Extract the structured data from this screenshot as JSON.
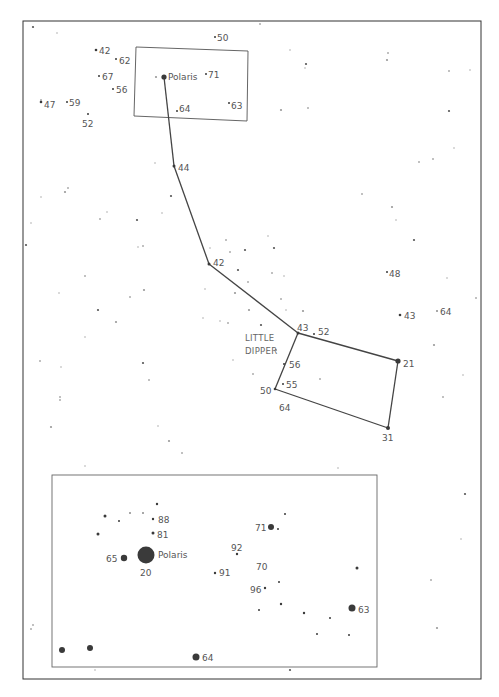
{
  "chart": {
    "title": "LITTLE DIPPER",
    "title_lines": [
      "LITTLE",
      "DIPPER"
    ],
    "colors": {
      "ink": "#3a3a3a",
      "label": "#555555",
      "faint": "#bbbbbb",
      "frame": "#333333",
      "inset_frame": "#666666"
    }
  },
  "main_map": {
    "frame": {
      "x": 23,
      "y": 21,
      "w": 458,
      "h": 658
    },
    "zoom_box": {
      "points": "136,47 248,51 247,121 134,116"
    },
    "constellation_lines": [
      [
        164,
        77,
        174,
        166
      ],
      [
        174,
        166,
        209,
        264
      ],
      [
        209,
        264,
        298,
        333
      ],
      [
        298,
        333,
        398,
        361
      ],
      [
        398,
        361,
        388,
        428
      ],
      [
        388,
        428,
        275,
        389
      ],
      [
        275,
        389,
        298,
        333
      ]
    ],
    "labeled_stars": [
      {
        "x": 164,
        "y": 77,
        "r": 2.6,
        "label": "Polaris",
        "lx": 168,
        "ly": 80
      },
      {
        "x": 174,
        "y": 166,
        "r": 1.5,
        "label": "44",
        "lx": 178,
        "ly": 171
      },
      {
        "x": 209,
        "y": 264,
        "r": 1.5,
        "label": "42",
        "lx": 213,
        "ly": 266
      },
      {
        "x": 298,
        "y": 333,
        "r": 1.5,
        "label": "43",
        "lx": 297,
        "ly": 331
      },
      {
        "x": 314,
        "y": 334,
        "r": 1,
        "label": "52",
        "lx": 318,
        "ly": 335
      },
      {
        "x": 398,
        "y": 361,
        "r": 2.6,
        "label": "21",
        "lx": 403,
        "ly": 367
      },
      {
        "x": 388,
        "y": 428,
        "r": 2,
        "label": "31",
        "lx": 382,
        "ly": 441
      },
      {
        "x": 275,
        "y": 389,
        "r": 1.3,
        "label": "50",
        "lx": 260,
        "ly": 394
      },
      {
        "x": 283,
        "y": 384,
        "r": 1,
        "label": "55",
        "lx": 286,
        "ly": 388
      },
      {
        "x": 284,
        "y": 364,
        "r": 1,
        "label": "56",
        "lx": 289,
        "ly": 368
      },
      {
        "x": 285,
        "y": 405,
        "r": 0,
        "label": "64",
        "lx": 279,
        "ly": 411
      },
      {
        "x": 387,
        "y": 272,
        "r": 1,
        "label": "48",
        "lx": 389,
        "ly": 277
      },
      {
        "x": 400,
        "y": 315,
        "r": 1.3,
        "label": "43",
        "lx": 404,
        "ly": 319
      },
      {
        "x": 437,
        "y": 311,
        "r": 0.8,
        "label": "64",
        "lx": 440,
        "ly": 315
      },
      {
        "x": 215,
        "y": 37,
        "r": 1,
        "label": "50",
        "lx": 217,
        "ly": 41
      },
      {
        "x": 96,
        "y": 50,
        "r": 1.3,
        "label": "42",
        "lx": 99,
        "ly": 54
      },
      {
        "x": 116,
        "y": 59,
        "r": 1,
        "label": "62",
        "lx": 119,
        "ly": 64
      },
      {
        "x": 99,
        "y": 76,
        "r": 1,
        "label": "67",
        "lx": 102,
        "ly": 80
      },
      {
        "x": 113,
        "y": 89,
        "r": 1,
        "label": "56",
        "lx": 116,
        "ly": 93
      },
      {
        "x": 41,
        "y": 102,
        "r": 1.3,
        "label": "47",
        "lx": 44,
        "ly": 108
      },
      {
        "x": 67,
        "y": 102,
        "r": 1,
        "label": "59",
        "lx": 69,
        "ly": 106
      },
      {
        "x": 88,
        "y": 114,
        "r": 1,
        "label": "52",
        "lx": 82,
        "ly": 127
      },
      {
        "x": 206,
        "y": 74,
        "r": 1,
        "label": "71",
        "lx": 208,
        "ly": 78
      },
      {
        "x": 177,
        "y": 111,
        "r": 1,
        "label": "64",
        "lx": 179,
        "ly": 112
      },
      {
        "x": 229,
        "y": 103,
        "r": 1,
        "label": "63",
        "lx": 231,
        "ly": 109
      }
    ],
    "background_stars": [
      [
        33,
        27
      ],
      [
        57,
        33
      ],
      [
        41,
        100
      ],
      [
        156,
        77
      ],
      [
        260,
        24
      ],
      [
        290,
        50
      ],
      [
        306,
        64
      ],
      [
        305,
        68
      ],
      [
        388,
        53
      ],
      [
        387,
        60
      ],
      [
        449,
        71
      ],
      [
        470,
        70
      ],
      [
        449,
        111
      ],
      [
        454,
        148
      ],
      [
        433,
        159
      ],
      [
        281,
        110
      ],
      [
        308,
        108
      ],
      [
        31,
        223
      ],
      [
        26,
        245
      ],
      [
        41,
        197
      ],
      [
        68,
        188
      ],
      [
        65,
        192
      ],
      [
        100,
        219
      ],
      [
        107,
        212
      ],
      [
        137,
        220
      ],
      [
        138,
        247
      ],
      [
        143,
        246
      ],
      [
        144,
        290
      ],
      [
        85,
        276
      ],
      [
        59,
        293
      ],
      [
        98,
        310
      ],
      [
        85,
        337
      ],
      [
        60,
        397
      ],
      [
        51,
        427
      ],
      [
        40,
        361
      ],
      [
        61,
        367
      ],
      [
        143,
        363
      ],
      [
        158,
        426
      ],
      [
        149,
        380
      ],
      [
        169,
        441
      ],
      [
        182,
        453
      ],
      [
        205,
        289
      ],
      [
        238,
        270
      ],
      [
        233,
        360
      ],
      [
        253,
        374
      ],
      [
        249,
        310
      ],
      [
        228,
        323
      ],
      [
        220,
        321
      ],
      [
        261,
        325
      ],
      [
        284,
        276
      ],
      [
        281,
        299
      ],
      [
        303,
        311
      ],
      [
        248,
        282
      ],
      [
        203,
        318
      ],
      [
        171,
        196
      ],
      [
        162,
        213
      ],
      [
        230,
        252
      ],
      [
        235,
        293
      ],
      [
        272,
        273
      ],
      [
        286,
        310
      ],
      [
        245,
        250
      ],
      [
        268,
        236
      ],
      [
        362,
        194
      ],
      [
        392,
        207
      ],
      [
        419,
        162
      ],
      [
        396,
        220
      ],
      [
        414,
        240
      ],
      [
        447,
        278
      ],
      [
        476,
        298
      ],
      [
        434,
        345
      ],
      [
        443,
        397
      ],
      [
        463,
        375
      ],
      [
        465,
        494
      ],
      [
        461,
        539
      ],
      [
        431,
        580
      ],
      [
        437,
        628
      ],
      [
        31,
        629
      ],
      [
        95,
        670
      ],
      [
        290,
        670
      ],
      [
        85,
        466
      ],
      [
        60,
        400
      ],
      [
        116,
        322
      ],
      [
        130,
        297
      ],
      [
        210,
        248
      ],
      [
        274,
        248
      ],
      [
        155,
        163
      ],
      [
        226,
        240
      ],
      [
        276,
        350
      ],
      [
        320,
        379
      ],
      [
        338,
        468
      ],
      [
        370,
        495
      ],
      [
        371,
        553
      ],
      [
        33,
        625
      ]
    ]
  },
  "inset_map": {
    "frame": {
      "x": 52,
      "y": 475,
      "w": 325,
      "h": 192
    },
    "labeled_stars": [
      {
        "x": 146,
        "y": 555,
        "r": 8.5,
        "label": "Polaris",
        "lx": 158,
        "ly": 558
      },
      {
        "x": 146,
        "y": 555,
        "r": 0,
        "label": "20",
        "lx": 140,
        "ly": 576
      },
      {
        "x": 124,
        "y": 558,
        "r": 3.2,
        "label": "65",
        "lx": 106,
        "ly": 562
      },
      {
        "x": 153,
        "y": 519,
        "r": 1.2,
        "label": "88",
        "lx": 158,
        "ly": 523
      },
      {
        "x": 153,
        "y": 533,
        "r": 1.5,
        "label": "81",
        "lx": 157,
        "ly": 538
      },
      {
        "x": 215,
        "y": 573,
        "r": 1.2,
        "label": "91",
        "lx": 219,
        "ly": 576
      },
      {
        "x": 237,
        "y": 554,
        "r": 1.2,
        "label": "92",
        "lx": 231,
        "ly": 551
      },
      {
        "x": 250,
        "y": 566,
        "r": 0,
        "label": "70",
        "lx": 256,
        "ly": 570
      },
      {
        "x": 265,
        "y": 588,
        "r": 1.2,
        "label": "96",
        "lx": 250,
        "ly": 593
      },
      {
        "x": 271,
        "y": 527,
        "r": 3,
        "label": "71",
        "lx": 255,
        "ly": 531
      },
      {
        "x": 352,
        "y": 608,
        "r": 3.5,
        "label": "63",
        "lx": 358,
        "ly": 613
      },
      {
        "x": 196,
        "y": 657,
        "r": 3.5,
        "label": "64",
        "lx": 202,
        "ly": 661
      }
    ],
    "background_stars": [
      [
        157,
        504,
        1.2
      ],
      [
        105,
        516,
        1.5
      ],
      [
        119,
        521,
        1
      ],
      [
        130,
        513,
        0.8
      ],
      [
        143,
        513,
        0.8
      ],
      [
        98,
        534,
        1.5
      ],
      [
        285,
        514,
        1
      ],
      [
        278,
        529,
        1
      ],
      [
        279,
        582,
        1
      ],
      [
        259,
        610,
        1
      ],
      [
        281,
        604,
        1.2
      ],
      [
        304,
        613,
        1.2
      ],
      [
        330,
        618,
        1
      ],
      [
        317,
        634,
        1
      ],
      [
        349,
        635,
        1
      ],
      [
        357,
        568,
        1.5
      ],
      [
        62,
        650,
        3
      ],
      [
        90,
        648,
        3
      ]
    ]
  }
}
